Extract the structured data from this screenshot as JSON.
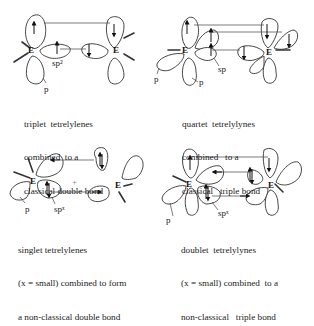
{
  "panels": [
    {
      "id": "triplet",
      "element_left": "E",
      "element_right": "E",
      "orbital_labels": [
        "sp²",
        "p"
      ],
      "caption": [
        "triplet  tetrelylenes",
        "combined  to a",
        "classical double bond"
      ]
    },
    {
      "id": "quartet",
      "element_left": "E",
      "element_right": "E",
      "orbital_labels": [
        "sp",
        "p",
        "p"
      ],
      "caption": [
        "quartet  tetrelylynes",
        "combined   to a",
        "classical   triple bond"
      ]
    },
    {
      "id": "singlet",
      "element_left": "E",
      "element_right": "E",
      "orbital_labels": [
        "p",
        "spˣ"
      ],
      "center_mark": "+",
      "caption": [
        "singlet tetrelylenes",
        "(x = small) combined to form",
        "a non-classical double bond"
      ]
    },
    {
      "id": "doublet",
      "element_left": "E",
      "element_right": "E",
      "orbital_labels": [
        "p",
        "spˣ"
      ],
      "caption": [
        "doublet  tetrelylynes",
        "(x = small) combined  to a",
        "non-classical   triple bond"
      ]
    }
  ]
}
